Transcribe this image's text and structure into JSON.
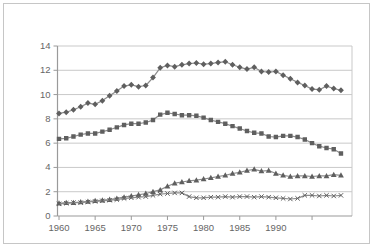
{
  "figure": {
    "background_color": "#ffffff",
    "frame_color": "#c6c6c6"
  },
  "chart_data": {
    "type": "line",
    "title": "",
    "xlabel": "",
    "ylabel": "",
    "legend_position": "none",
    "grid": "horizontal-gridlines",
    "ylim": [
      0,
      14
    ],
    "y_ticks": [
      0,
      2,
      4,
      6,
      8,
      10,
      12,
      14
    ],
    "x_ticks": [
      {
        "year": 1960,
        "label": "1960"
      },
      {
        "year": 1965,
        "label": "1965"
      },
      {
        "year": 1970,
        "label": "1970"
      },
      {
        "year": 1975,
        "label": "1975"
      },
      {
        "year": 1980,
        "label": "1980"
      },
      {
        "year": 1985,
        "label": "1985"
      },
      {
        "year": 1990,
        "label": "1990"
      },
      {
        "year": 1995,
        "label": ""
      }
    ],
    "x_years": [
      1960,
      1961,
      1962,
      1963,
      1964,
      1965,
      1966,
      1967,
      1968,
      1969,
      1970,
      1971,
      1972,
      1973,
      1974,
      1975,
      1976,
      1977,
      1978,
      1979,
      1980,
      1981,
      1982,
      1983,
      1984,
      1985,
      1986,
      1987,
      1988,
      1989,
      1990,
      1991,
      1992,
      1993,
      1994,
      1995,
      1996,
      1997,
      1998,
      1999
    ],
    "series": [
      {
        "name": "series-1-diamond",
        "marker": "diamond",
        "values": [
          8.45,
          8.55,
          8.75,
          9.0,
          9.3,
          9.2,
          9.5,
          9.9,
          10.3,
          10.7,
          10.8,
          10.65,
          10.75,
          11.4,
          12.2,
          12.4,
          12.3,
          12.45,
          12.55,
          12.6,
          12.5,
          12.55,
          12.65,
          12.7,
          12.45,
          12.25,
          12.1,
          12.25,
          11.9,
          11.85,
          11.9,
          11.6,
          11.3,
          11.0,
          10.75,
          10.45,
          10.4,
          10.7,
          10.5,
          10.35
        ]
      },
      {
        "name": "series-2-square",
        "marker": "square",
        "values": [
          6.35,
          6.4,
          6.55,
          6.7,
          6.8,
          6.8,
          6.95,
          7.1,
          7.3,
          7.5,
          7.6,
          7.6,
          7.7,
          7.9,
          8.35,
          8.5,
          8.4,
          8.3,
          8.3,
          8.25,
          8.1,
          7.9,
          7.75,
          7.6,
          7.4,
          7.2,
          7.0,
          6.85,
          6.8,
          6.55,
          6.5,
          6.6,
          6.6,
          6.5,
          6.3,
          6.0,
          5.75,
          5.6,
          5.5,
          5.15
        ]
      },
      {
        "name": "series-3-triangle",
        "marker": "triangle",
        "values": [
          1.05,
          1.1,
          1.1,
          1.15,
          1.2,
          1.25,
          1.3,
          1.35,
          1.45,
          1.55,
          1.65,
          1.75,
          1.85,
          2.0,
          2.15,
          2.45,
          2.7,
          2.8,
          2.9,
          2.95,
          3.05,
          3.15,
          3.25,
          3.35,
          3.5,
          3.6,
          3.75,
          3.85,
          3.7,
          3.75,
          3.5,
          3.35,
          3.25,
          3.3,
          3.3,
          3.25,
          3.3,
          3.3,
          3.4,
          3.35
        ]
      },
      {
        "name": "series-4-cross",
        "marker": "x",
        "values": [
          1.0,
          1.05,
          1.1,
          1.1,
          1.15,
          1.2,
          1.25,
          1.3,
          1.35,
          1.45,
          1.5,
          1.55,
          1.6,
          1.7,
          1.8,
          1.85,
          1.9,
          1.9,
          1.6,
          1.5,
          1.5,
          1.55,
          1.55,
          1.6,
          1.55,
          1.6,
          1.6,
          1.55,
          1.6,
          1.55,
          1.5,
          1.45,
          1.4,
          1.45,
          1.7,
          1.7,
          1.65,
          1.7,
          1.65,
          1.7
        ]
      }
    ],
    "colors": {
      "axis": "#9a9a9a",
      "gridline": "#c9c9c9",
      "line": "#8c8c8c",
      "marker": "#5f5f5f",
      "tick_label": "#666666"
    },
    "plot_box": {
      "left": 57.5,
      "right": 352,
      "top": 46,
      "bottom": 216
    },
    "x_scale": {
      "year0": 1960,
      "x0": 59,
      "px_per_year": 7.23
    }
  }
}
